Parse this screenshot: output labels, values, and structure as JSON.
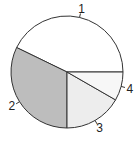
{
  "chart_data": {
    "type": "pie",
    "title": "",
    "categories": [
      "1",
      "2",
      "3",
      "4"
    ],
    "values": [
      42.8,
      32.2,
      16.7,
      8.3
    ],
    "colors": [
      "#ffffff",
      "#bdbdbd",
      "#ededed",
      "#f7f7f7"
    ],
    "start_angle_deg": 0,
    "direction": "counterclockwise",
    "legend": "none"
  }
}
